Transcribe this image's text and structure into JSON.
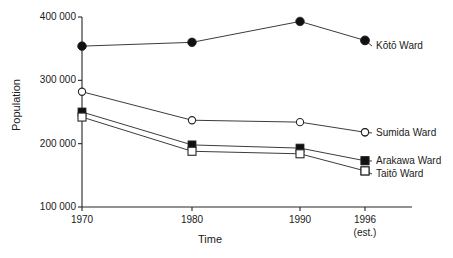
{
  "chart_data": {
    "type": "line",
    "title": "",
    "xlabel": "Time",
    "ylabel": "Population",
    "x": [
      1970,
      1980,
      1990,
      1996
    ],
    "xtick_labels": [
      "1970",
      "1980",
      "1990",
      "1996"
    ],
    "xtick_sublabels": [
      "",
      "",
      "",
      "(est.)"
    ],
    "ytick_labels": [
      "400 000",
      "300 000",
      "200 000",
      "100 000"
    ],
    "ytick_values": [
      400000,
      300000,
      200000,
      100000
    ],
    "ylim": [
      100000,
      400000
    ],
    "grid": false,
    "legend_position": "right-inline",
    "series": [
      {
        "name": "Kōtō Ward",
        "marker": "filled-circle",
        "values": [
          354000,
          360000,
          393000,
          363000
        ]
      },
      {
        "name": "Sumida Ward",
        "marker": "open-circle",
        "values": [
          282000,
          237000,
          234000,
          218000
        ]
      },
      {
        "name": "Arakawa Ward",
        "marker": "filled-square",
        "values": [
          250000,
          198000,
          193000,
          173000
        ]
      },
      {
        "name": "Taitō Ward",
        "marker": "open-square",
        "values": [
          242000,
          188000,
          184000,
          157000
        ]
      }
    ]
  },
  "axes": {
    "ylabel": "Population",
    "xlabel": "Time"
  },
  "yticks": [
    {
      "label": "400 000"
    },
    {
      "label": "300 000"
    },
    {
      "label": "200 000"
    },
    {
      "label": "100 000"
    }
  ],
  "xticks": [
    {
      "label": "1970",
      "sublabel": ""
    },
    {
      "label": "1980",
      "sublabel": ""
    },
    {
      "label": "1990",
      "sublabel": ""
    },
    {
      "label": "1996",
      "sublabel": "(est.)"
    }
  ],
  "legend": [
    {
      "label": "Kōtō Ward"
    },
    {
      "label": "Sumida Ward"
    },
    {
      "label": "Arakawa Ward"
    },
    {
      "label": "Taitō Ward"
    }
  ],
  "colors": {
    "line": "#262626",
    "marker_fill": "#111111",
    "marker_open": "#ffffff",
    "text": "#1a1a1a",
    "background": "#ffffff"
  }
}
